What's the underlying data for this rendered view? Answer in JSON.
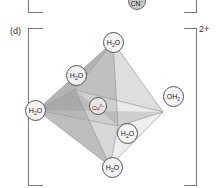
{
  "panel_c": {
    "ligand_bottom": "CN",
    "ligand_bottom_charge": "−"
  },
  "panel_d": {
    "label": "(d)",
    "charge": "2+",
    "center": {
      "symbol": "Cu",
      "charge": "2+"
    },
    "ligands": {
      "top": {
        "text": "H",
        "sub": "2",
        "tail": "O"
      },
      "upper_back": {
        "text": "H",
        "sub": "2",
        "tail": "O"
      },
      "left": {
        "text": "H",
        "sub": "2",
        "tail": "O"
      },
      "right": {
        "text": "OH",
        "sub": "2",
        "tail": ""
      },
      "lower_front": {
        "text": "H",
        "sub": "2",
        "tail": "O"
      },
      "bottom": {
        "text": "H",
        "sub": "2",
        "tail": "O"
      }
    }
  },
  "colors": {
    "bracket": "#777777",
    "atom_fill": "#f2f2f2",
    "atom_stroke": "#555555",
    "face_dark": "#8a8a8a",
    "face_light": "#cfcfcf"
  }
}
